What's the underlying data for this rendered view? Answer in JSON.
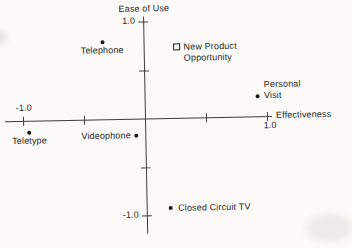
{
  "figure": {
    "paper_color": "#fbfaf8",
    "ink_color": "#262626",
    "line_color": "#3d3d3d"
  },
  "chart_data": {
    "type": "scatter",
    "title": "",
    "y_axis_label": "Ease of Use",
    "x_axis_label": "Effectiveness",
    "xlim": [
      -1.0,
      1.0
    ],
    "ylim": [
      -1.0,
      1.0
    ],
    "x_ticks": [
      -1.0,
      -0.5,
      0.5,
      1.0
    ],
    "y_ticks": [
      -1.0,
      -0.5,
      0.5,
      1.0
    ],
    "grid": false,
    "legend": "none",
    "axis_tick_labels": {
      "x_left": "-1.0",
      "x_right": "1.0",
      "y_top": "1.0",
      "y_bottom": "-1.0"
    },
    "points": [
      {
        "label": "Telephone",
        "label_lines": [
          "Telephone"
        ],
        "x": -0.34,
        "y": 0.79,
        "marker": "dot",
        "label_pos": "below"
      },
      {
        "label": "New Product Opportunity",
        "label_lines": [
          "New Product",
          "Opportunity"
        ],
        "x": 0.27,
        "y": 0.73,
        "marker": "open-square",
        "label_pos": "right"
      },
      {
        "label": "Personal Visit",
        "label_lines": [
          "Personal",
          "Visit"
        ],
        "x": 0.93,
        "y": 0.21,
        "marker": "dot",
        "label_pos": "right-above"
      },
      {
        "label": "Teletype",
        "label_lines": [
          "Teletype"
        ],
        "x": -0.95,
        "y": -0.12,
        "marker": "dot",
        "label_pos": "below"
      },
      {
        "label": "Videophone",
        "label_lines": [
          "Videophone"
        ],
        "x": -0.07,
        "y": -0.18,
        "marker": "dot",
        "label_pos": "left"
      },
      {
        "label": "Closed Circuit TV",
        "label_lines": [
          "Closed Circuit TV"
        ],
        "x": 0.2,
        "y": -0.93,
        "marker": "dot",
        "label_pos": "right"
      }
    ]
  }
}
